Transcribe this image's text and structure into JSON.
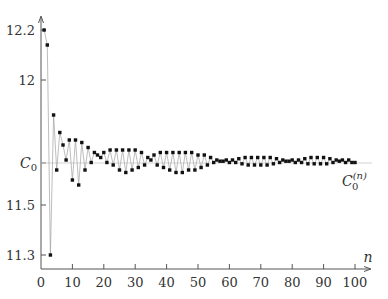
{
  "chart_data": {
    "type": "line",
    "title": "",
    "xlabel": "n",
    "ylabel": "",
    "xlim": [
      0,
      105
    ],
    "ylim": [
      11.28,
      12.25
    ],
    "grid": false,
    "legend": null,
    "x_ticks": [
      0,
      10,
      20,
      30,
      40,
      50,
      60,
      70,
      80,
      90,
      100
    ],
    "x_tick_labels": [
      "0",
      "10",
      "20",
      "30",
      "40",
      "50",
      "60",
      "70",
      "80",
      "90",
      "100"
    ],
    "y_ticks": [
      11.3,
      11.5,
      11.668,
      12,
      12.2
    ],
    "y_tick_labels": [
      "11.3",
      "11.5",
      "C0",
      "12",
      "12.2"
    ],
    "reference_line": {
      "label": "C0",
      "value": 11.668
    },
    "series_label": "C0^(n)",
    "series": [
      {
        "name": "C0^(n)",
        "marker": "square-dot",
        "x": [
          1,
          2,
          3,
          4,
          5,
          6,
          7,
          8,
          9,
          10,
          11,
          12,
          13,
          14,
          15,
          16,
          17,
          18,
          19,
          20,
          21,
          22,
          23,
          24,
          25,
          26,
          27,
          28,
          29,
          30,
          31,
          32,
          33,
          34,
          35,
          36,
          37,
          38,
          39,
          40,
          41,
          42,
          43,
          44,
          45,
          46,
          47,
          48,
          49,
          50,
          51,
          52,
          53,
          54,
          55,
          56,
          57,
          58,
          59,
          60,
          61,
          62,
          63,
          64,
          65,
          66,
          67,
          68,
          69,
          70,
          71,
          72,
          73,
          74,
          75,
          76,
          77,
          78,
          79,
          80,
          81,
          82,
          83,
          84,
          85,
          86,
          87,
          88,
          89,
          90,
          91,
          92,
          93,
          94,
          95,
          96,
          97,
          98,
          99,
          100
        ],
        "values": [
          12.2,
          12.14,
          11.3,
          11.86,
          11.64,
          11.79,
          11.74,
          11.68,
          11.76,
          11.6,
          11.76,
          11.58,
          11.75,
          11.64,
          11.73,
          11.67,
          11.71,
          11.7,
          11.69,
          11.71,
          11.67,
          11.72,
          11.66,
          11.72,
          11.64,
          11.72,
          11.63,
          11.72,
          11.64,
          11.72,
          11.65,
          11.71,
          11.66,
          11.69,
          11.68,
          11.7,
          11.66,
          11.71,
          11.65,
          11.71,
          11.64,
          11.71,
          11.63,
          11.71,
          11.63,
          11.71,
          11.64,
          11.71,
          11.64,
          11.7,
          11.65,
          11.7,
          11.66,
          11.69,
          11.67,
          11.68,
          11.675,
          11.675,
          11.68,
          11.67,
          11.68,
          11.67,
          11.685,
          11.665,
          11.69,
          11.66,
          11.69,
          11.66,
          11.69,
          11.66,
          11.69,
          11.66,
          11.69,
          11.665,
          11.685,
          11.67,
          11.68,
          11.675,
          11.675,
          11.68,
          11.67,
          11.68,
          11.67,
          11.685,
          11.665,
          11.69,
          11.665,
          11.69,
          11.665,
          11.69,
          11.665,
          11.685,
          11.67,
          11.68,
          11.675,
          11.68,
          11.67,
          11.68,
          11.67,
          11.67
        ]
      }
    ]
  },
  "labels": {
    "x_axis_var": "n",
    "c0_label": "C",
    "c0_sub": "0",
    "series_label_base": "C",
    "series_label_sub": "0",
    "series_label_sup": "(n)"
  }
}
